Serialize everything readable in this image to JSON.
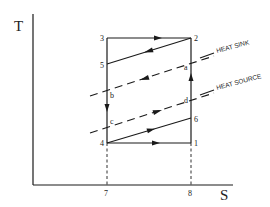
{
  "diagram": {
    "type": "T-S diagram (heat pump / refrigeration cycle)",
    "axes": {
      "y_label": "T",
      "x_label": "S",
      "x_ticks": [
        "7",
        "8"
      ]
    },
    "points": {
      "p1": "1",
      "p2": "2",
      "p3": "3",
      "p4": "4",
      "p5": "5",
      "p6": "6",
      "pa": "a",
      "pb": "b",
      "pc": "c",
      "pd": "d"
    },
    "annotations": {
      "heat_sink": "HEAT SINK",
      "heat_source": "HEAT SOURCE"
    },
    "colors": {
      "line": "#1a1a1a",
      "background": "#ffffff"
    }
  }
}
